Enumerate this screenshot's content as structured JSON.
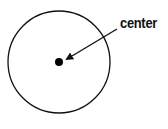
{
  "diagram": {
    "label": "center",
    "circle": {
      "cx": 59,
      "cy": 62,
      "r": 51,
      "stroke": "#111111"
    },
    "center_point": {
      "cx": 59,
      "cy": 62,
      "r": 4,
      "fill": "#000000"
    },
    "arrow": {
      "from": [
        117,
        29
      ],
      "to": [
        66,
        60
      ],
      "color": "#111111"
    }
  }
}
